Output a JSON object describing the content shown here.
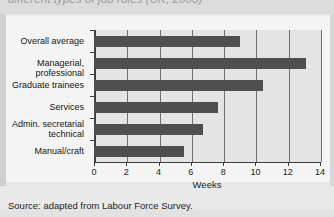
{
  "figure": {
    "title_clipped": "different types of job roles (UK, 2003)",
    "source_note": "Source: adapted from Labour Force Survey."
  },
  "chart_data": {
    "type": "bar",
    "orientation": "horizontal",
    "title": "different types of job roles (UK, 2003)",
    "xlabel": "Weeks",
    "ylabel": "",
    "xlim": [
      0,
      14
    ],
    "xticks": [
      0,
      2,
      4,
      6,
      8,
      10,
      12,
      14
    ],
    "xtick_labels": [
      "0",
      "2",
      "4",
      "6",
      "8",
      "10",
      "12",
      "14"
    ],
    "grid": true,
    "grid_axis": "x",
    "legend": false,
    "bar_color": "#4f4f4f",
    "plot_background": "#e4e4e4",
    "categories": [
      "Overall average",
      "Managerial, professional",
      "Graduate trainees",
      "Services",
      "Admin. secretarial\ntechnical",
      "Manual/craft"
    ],
    "values": [
      9.0,
      13.1,
      10.4,
      7.6,
      6.7,
      5.5
    ],
    "units": "weeks"
  }
}
